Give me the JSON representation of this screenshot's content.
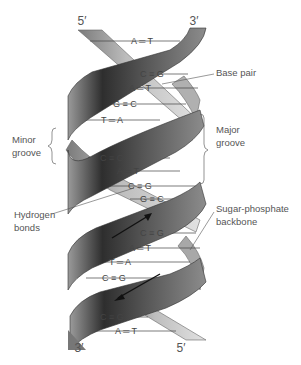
{
  "strand_ends": {
    "top_left": "5′",
    "top_right": "3′",
    "bottom_left": "3′",
    "bottom_right": "5′"
  },
  "labels": {
    "base_pair": "Base pair",
    "minor_groove_line1": "Minor",
    "minor_groove_line2": "groove",
    "major_groove_line1": "Major",
    "major_groove_line2": "groove",
    "hydrogen_bonds_line1": "Hydrogen",
    "hydrogen_bonds_line2": "bonds",
    "backbone_line1": "Sugar-phosphate",
    "backbone_line2": "backbone"
  },
  "base_pairs": [
    {
      "left": "A",
      "bond": "===",
      "right": "T"
    },
    {
      "left": "C",
      "bond": "≡≡≡",
      "right": "G"
    },
    {
      "left": "A",
      "bond": "===",
      "right": "T"
    },
    {
      "left": "G",
      "bond": "≡≡≡",
      "right": "C"
    },
    {
      "left": "T",
      "bond": "===",
      "right": "A"
    },
    {
      "left": "C",
      "bond": "≡≡≡",
      "right": "G"
    },
    {
      "left": "A",
      "bond": "===",
      "right": "T"
    },
    {
      "left": "C",
      "bond": "≡≡≡",
      "right": "G"
    },
    {
      "left": "G",
      "bond": "≡≡≡",
      "right": "C"
    },
    {
      "left": "C",
      "bond": "≡≡≡",
      "right": "G"
    },
    {
      "left": "A",
      "bond": "===",
      "right": "T"
    },
    {
      "left": "T",
      "bond": "===",
      "right": "A"
    },
    {
      "left": "C",
      "bond": "≡≡≡",
      "right": "G"
    },
    {
      "left": "C",
      "bond": "≡≡≡",
      "right": "G"
    },
    {
      "left": "A",
      "bond": "===",
      "right": "T"
    }
  ],
  "bp_text": [
    "A ═ T",
    "C ≡ G",
    "A ═ T",
    "G ≡ C",
    "T ═ A",
    "C ≡ G",
    "A ═ T",
    "C ≡ G",
    "G ≡ C",
    "C ≡ G",
    "A ═ T",
    "T ═ A",
    "C ≡ G",
    "C ≡ G",
    "A ═ T"
  ],
  "colors": {
    "strand_dark": "#3a3a3a",
    "strand_mid": "#8a8a8a",
    "strand_light": "#d8d8d8",
    "line": "#555555",
    "text": "#555555"
  }
}
